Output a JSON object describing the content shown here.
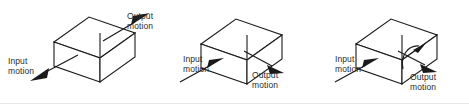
{
  "figure": {
    "background_color": "#ffffff",
    "line_color": "#1a1a1a",
    "text_color": "#2b2b2b",
    "panel_count": 3
  },
  "labels": {
    "input_line1": "Input",
    "input_line2": "motion",
    "output_line1": "Output",
    "output_line2": "motion"
  },
  "panels": [
    {
      "id": "panel-1",
      "name": "linear-to-linear-reversing",
      "shape": "rectangular-box-isometric",
      "input": {
        "label_line1": "Input",
        "label_line2": "motion",
        "arrow_type": "straight",
        "direction": "down-left",
        "position": "left"
      },
      "output": {
        "label_line1": "Output",
        "label_line2": "motion",
        "arrow_type": "straight",
        "direction": "up-right",
        "position": "top-right"
      }
    },
    {
      "id": "panel-2",
      "name": "linear-to-linear-parallel",
      "shape": "rectangular-box-isometric",
      "input": {
        "label_line1": "Input",
        "label_line2": "motion",
        "arrow_type": "straight",
        "direction": "up-right",
        "position": "left"
      },
      "output": {
        "label_line1": "Output",
        "label_line2": "motion",
        "arrow_type": "straight",
        "direction": "down-right",
        "position": "bottom-right"
      }
    },
    {
      "id": "panel-3",
      "name": "linear-to-rotary",
      "shape": "rectangular-box-isometric",
      "input": {
        "label_line1": "Input",
        "label_line2": "motion",
        "arrow_type": "straight",
        "direction": "up-right",
        "position": "left"
      },
      "output": {
        "label_line1": "Output",
        "label_line2": "motion",
        "arrow_type": "curved-rotational",
        "direction": "clockwise-about-axis",
        "position": "bottom-right"
      }
    }
  ]
}
